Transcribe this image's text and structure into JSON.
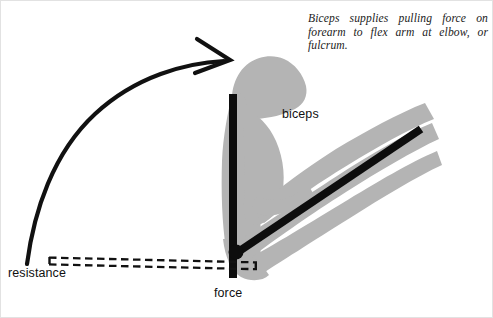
{
  "figure": {
    "background_color": "#ffffff",
    "border_color": "#e2e2e2"
  },
  "caption": {
    "text": "Biceps supplies pulling force on forearm to flex arm at elbow, or fulcrum."
  },
  "labels": {
    "biceps": "biceps",
    "force": "force",
    "resistance": "resistance"
  },
  "colors": {
    "silhouette_gray": "#b4b4b4",
    "bone_black": "#0d0d0d",
    "arrow_black": "#111111",
    "text_black": "#111111",
    "page_white": "#ffffff"
  },
  "diagram": {
    "type": "third-class-lever anatomy diagram",
    "elements": [
      {
        "name": "humerus-bar",
        "role": "upper arm bone / effort line",
        "orientation": "vertical",
        "x": 228,
        "y_top": 93,
        "y_bottom": 277,
        "thickness": 8,
        "color": "#0d0d0d"
      },
      {
        "name": "forearm-bar",
        "role": "forearm bone / lever arm",
        "orientation": "diagonal",
        "from": [
          236,
          252
        ],
        "to": [
          420,
          128
        ],
        "thickness": 8,
        "color": "#0d0d0d"
      },
      {
        "name": "fulcrum-dot",
        "role": "elbow pivot point",
        "cx": 235,
        "cy": 251,
        "r": 7,
        "color": "#0d0d0d"
      },
      {
        "name": "resistance-bar",
        "role": "dashed hollow resistance line",
        "from": [
          47,
          256
        ],
        "to": [
          256,
          262
        ],
        "style": "dashed outline",
        "color": "#111111"
      },
      {
        "name": "motion-arrow",
        "role": "curved arrow showing direction of flexion",
        "from": [
          26,
          263
        ],
        "to": [
          228,
          60
        ],
        "style": "curved with open chevron arrowhead",
        "color": "#111111"
      },
      {
        "name": "arm-silhouette",
        "role": "gray flexed arm outline",
        "color": "#b4b4b4"
      }
    ]
  }
}
